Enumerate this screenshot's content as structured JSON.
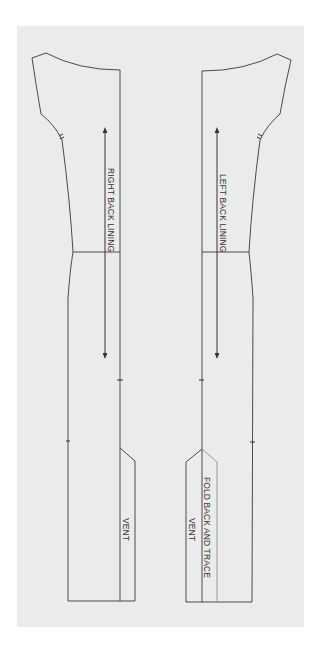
{
  "diagram": {
    "type": "sewing-pattern",
    "background_color": "#ebebeb",
    "line_color": "#4a4a4a",
    "fold_line_color": "#9a9a9a",
    "pieces": [
      {
        "id": "right-back-lining",
        "label": "RIGHT BACK LINING",
        "vent_label": "VENT",
        "grainline": "double-headed arrow (vertical)"
      },
      {
        "id": "left-back-lining",
        "label": "LEFT BACK LINING",
        "vent_label": "VENT",
        "fold_label": "FOLD BACK AND TRACE",
        "grainline": "double-headed arrow (vertical)"
      }
    ]
  }
}
